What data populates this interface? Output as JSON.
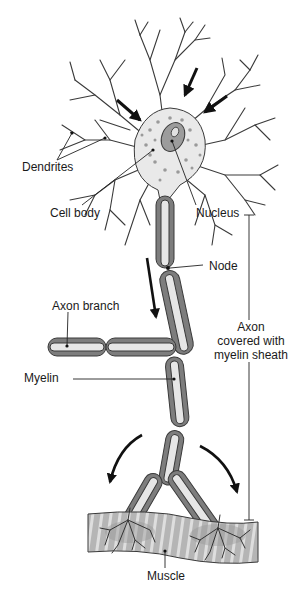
{
  "diagram": {
    "colors": {
      "outline": "#3a3a3a",
      "cytoplasm": "#e9e9e9",
      "myelin_dark": "#7d7d7d",
      "myelin_mid": "#a8a8a8",
      "axon_core": "#e6e6e6",
      "nucleus": "#9c9c9c",
      "muscle": "#b8b8b8",
      "muscle_stripe": "#d9d9d9",
      "arrow": "#111111"
    },
    "labels": {
      "dendrites": "Dendrites",
      "cell_body": "Cell body",
      "nucleus": "Nucleus",
      "node": "Node",
      "axon_branch": "Axon branch",
      "myelin": "Myelin",
      "axon_line1": "Axon",
      "axon_line2": "covered with",
      "axon_line3": "myelin sheath",
      "muscle": "Muscle"
    }
  }
}
